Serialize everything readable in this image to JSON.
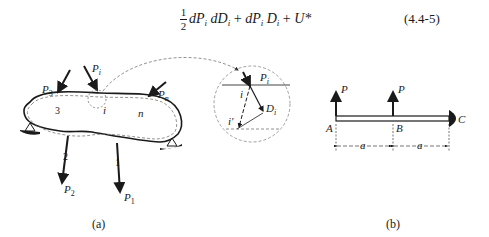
{
  "equation": {
    "half_numerator": "1",
    "half_denominator": "2",
    "term1": "dP",
    "term1_sub": "i",
    "term2": "dD",
    "term2_sub": "i",
    "plus1": "+",
    "term3": "dP",
    "term3_sub": "i",
    "term4": "D",
    "term4_sub": "i",
    "plus2": "+",
    "term5": "U*",
    "number": "(4.4-5)"
  },
  "figure_a": {
    "caption": "(a)",
    "loads": [
      {
        "label": "P",
        "sub": "3"
      },
      {
        "label": "P",
        "sub": "i"
      },
      {
        "label": "P",
        "sub": "n"
      },
      {
        "label": "P",
        "sub": "2"
      },
      {
        "label": "P",
        "sub": "1"
      }
    ],
    "points": [
      "3",
      "i",
      "n",
      "2",
      "1"
    ],
    "detail": {
      "load": "P",
      "load_sub": "i",
      "point": "i",
      "point_displaced": "i'",
      "displacement": "D",
      "displacement_sub": "i"
    }
  },
  "figure_b": {
    "caption": "(b)",
    "loads": [
      "P",
      "P"
    ],
    "nodes": [
      "A",
      "B",
      "C"
    ],
    "dimensions": [
      "a",
      "a"
    ]
  }
}
